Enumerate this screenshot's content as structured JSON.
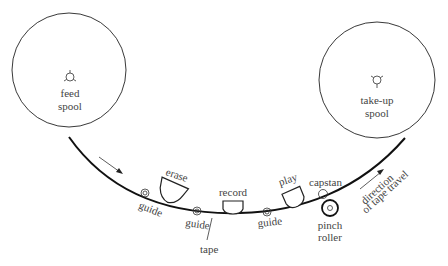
{
  "diagram": {
    "spools": {
      "feed": {
        "label_line1": "feed",
        "label_line2": "spool"
      },
      "takeup": {
        "label_line1": "take-up",
        "label_line2": "spool"
      }
    },
    "heads": {
      "erase": "erase",
      "record": "record",
      "play": "play"
    },
    "guides": [
      "guide",
      "guide",
      "guide"
    ],
    "capstan": "capstan",
    "pinch_roller": {
      "line1": "pinch",
      "line2": "roller"
    },
    "tape": "tape",
    "direction": {
      "line1": "direction",
      "line2": "of tape travel"
    }
  }
}
